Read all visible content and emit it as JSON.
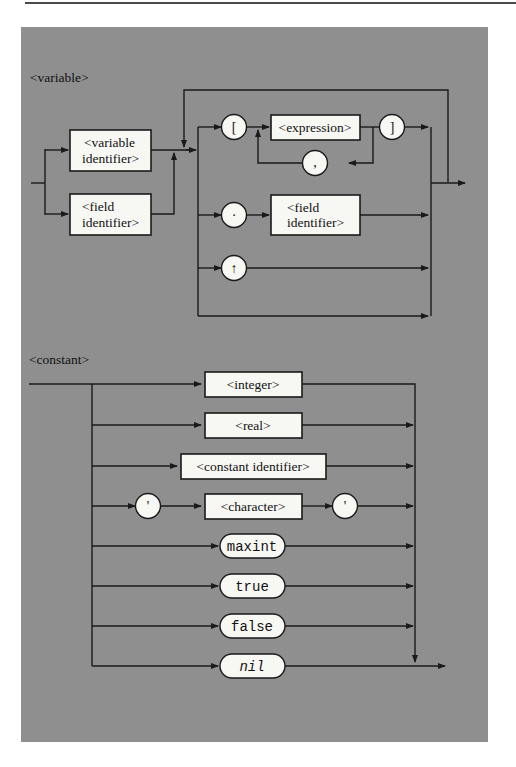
{
  "diagrams": [
    {
      "title": "<variable>",
      "entry_alternatives": [
        "<variable identifier>",
        "<field identifier>"
      ],
      "selector_alternatives": [
        {
          "path": [
            "[",
            "<expression>",
            "]"
          ],
          "repeat_separator": ","
        },
        {
          "path": [
            ".",
            "<field identifier>"
          ]
        },
        {
          "path": [
            "↑"
          ]
        },
        {
          "path": []
        }
      ],
      "loop": "selectors repeat back to start"
    },
    {
      "title": "<constant>",
      "alternatives": [
        [
          "<integer>"
        ],
        [
          "<real>"
        ],
        [
          "<constant identifier>"
        ],
        [
          "'",
          "<character>",
          "'"
        ],
        [
          "maxint"
        ],
        [
          "true"
        ],
        [
          "false"
        ],
        [
          "nil"
        ]
      ]
    }
  ],
  "variable": {
    "title": "<variable>",
    "box_var_id_l1": "<variable",
    "box_var_id_l2": "identifier>",
    "box_field_id_l1": "<field",
    "box_field_id_l2": "identifier>",
    "lbracket": "[",
    "expression": "<expression>",
    "rbracket": "]",
    "comma": ",",
    "dot": "·",
    "field2_l1": "<field",
    "field2_l2": "identifier>",
    "uparrow": "↑"
  },
  "constant": {
    "title": "<constant>",
    "integer": "<integer>",
    "real": "<real>",
    "const_id": "<constant identifier>",
    "quote_open": "'",
    "character": "<character>",
    "quote_close": "'",
    "maxint": "maxint",
    "true": "true",
    "false": "false",
    "nil": "nil"
  }
}
